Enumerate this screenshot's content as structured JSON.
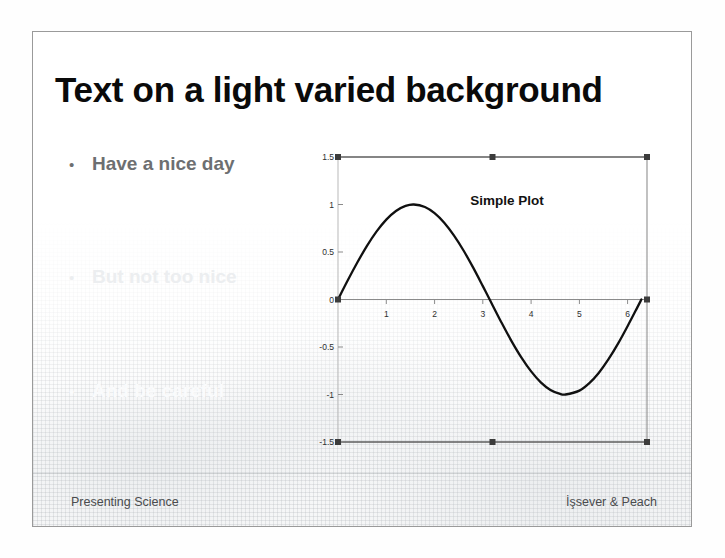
{
  "slide": {
    "title": "Text on a light varied background",
    "bullet_marker": "•",
    "bullets": [
      {
        "text": "Have a nice day",
        "color": "#6d6f71",
        "visibility": "visible"
      },
      {
        "text": "But not too nice",
        "color": "#eceef0",
        "visibility": "very-faint"
      },
      {
        "text": "And be careful",
        "color": "#fafbfc",
        "visibility": "nearly-invisible"
      }
    ],
    "footer": {
      "left": "Presenting Science",
      "right": "İşsever & Peach"
    },
    "colors": {
      "title": "#0a0a0a",
      "slide_background": "#ffffff",
      "slide_border": "#9a9a9a",
      "footer_text": "#4a4c4e",
      "plot_line": "#101010",
      "axis": "#6b6b6b",
      "selection_handle": "#3c3c3c"
    }
  },
  "chart_data": {
    "type": "line",
    "title": "Simple Plot",
    "xlabel": "",
    "ylabel": "",
    "xlim": [
      0,
      6.4
    ],
    "ylim": [
      -1.5,
      1.5
    ],
    "grid": false,
    "legend": "none",
    "xticks": [
      1,
      2,
      3,
      4,
      5,
      6
    ],
    "xtick_labels": [
      "1",
      "2",
      "3",
      "4",
      "5",
      "6"
    ],
    "yticks": [
      1.5,
      1,
      0.5,
      0,
      -0.5,
      -1,
      -1.5
    ],
    "ytick_labels": [
      "1.5",
      "1",
      "0.5",
      "0",
      "-0.5",
      "-1",
      "-1.5"
    ],
    "series": [
      {
        "name": "sin(x)",
        "x": [
          0.0,
          0.2,
          0.4,
          0.6,
          0.8,
          1.0,
          1.2,
          1.4,
          1.5708,
          1.8,
          2.0,
          2.2,
          2.4,
          2.6,
          2.8,
          3.0,
          3.1416,
          3.4,
          3.6,
          3.8,
          4.0,
          4.2,
          4.4,
          4.6,
          4.7124,
          5.0,
          5.2,
          5.4,
          5.6,
          5.8,
          6.0,
          6.2,
          6.2832
        ],
        "y": [
          0.0,
          0.199,
          0.389,
          0.565,
          0.717,
          0.841,
          0.932,
          0.985,
          1.0,
          0.974,
          0.909,
          0.808,
          0.675,
          0.516,
          0.335,
          0.141,
          0.0,
          -0.256,
          -0.443,
          -0.612,
          -0.757,
          -0.872,
          -0.952,
          -0.994,
          -1.0,
          -0.959,
          -0.883,
          -0.773,
          -0.631,
          -0.465,
          -0.279,
          -0.083,
          0.0
        ]
      }
    ],
    "selection_handles": {
      "shown": true,
      "count": 8,
      "positions": [
        "top-left",
        "top-center",
        "top-right",
        "middle-left",
        "middle-right",
        "bottom-left",
        "bottom-center",
        "bottom-right"
      ]
    }
  }
}
